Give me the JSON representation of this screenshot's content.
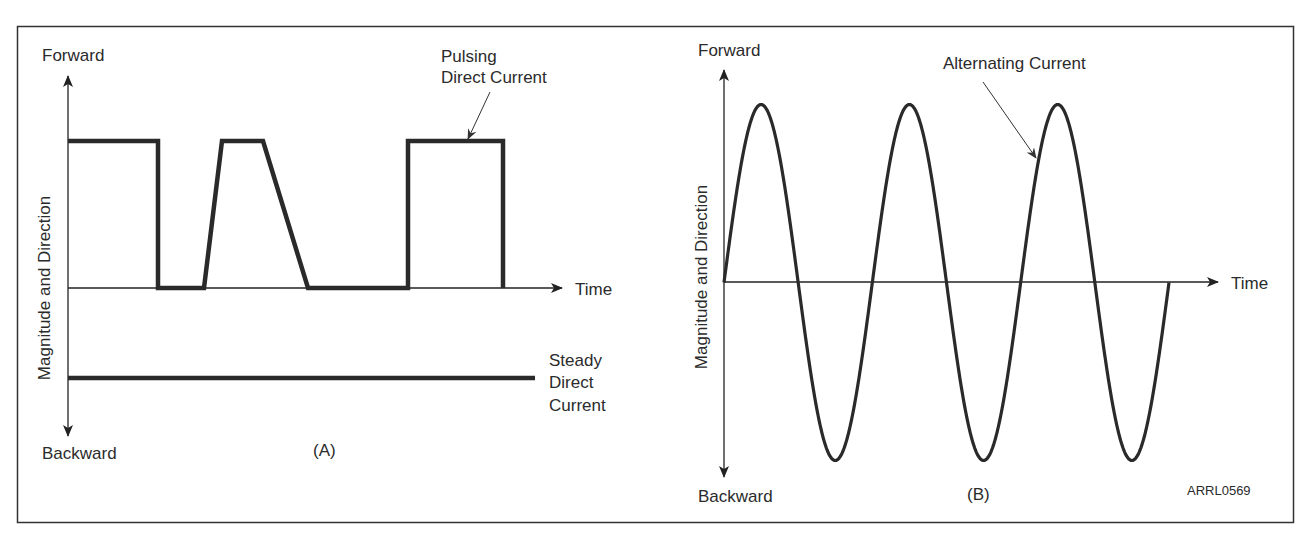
{
  "figure": {
    "id_label": "ARRL0569",
    "frame": {
      "stroke": "#333333"
    }
  },
  "panels": [
    {
      "key": "A",
      "caption": "(A)",
      "y_axis": {
        "top_label": "Forward",
        "bottom_label": "Backward",
        "title": "Magnitude and Direction"
      },
      "x_axis": {
        "label": "Time"
      },
      "annotations": [
        {
          "lines": [
            "Pulsing",
            "Direct Current"
          ]
        },
        {
          "lines": [
            "Steady",
            "Direct",
            "Current"
          ]
        }
      ]
    },
    {
      "key": "B",
      "caption": "(B)",
      "y_axis": {
        "top_label": "Forward",
        "bottom_label": "Backward",
        "title": "Magnitude and Direction"
      },
      "x_axis": {
        "label": "Time"
      },
      "annotations": [
        {
          "lines": [
            "Alternating Current"
          ]
        }
      ]
    }
  ],
  "chart_data": [
    {
      "type": "line",
      "title": "(A)",
      "xlabel": "Time",
      "ylabel": "Magnitude and Direction",
      "y_top_label": "Forward",
      "y_bottom_label": "Backward",
      "grid": false,
      "series": [
        {
          "name": "Pulsing Direct Current",
          "description": "Rectangular pulse, then trapezoidal pulse, then rectangular pulse; all above zero",
          "x": [
            0,
            0.22,
            0.22,
            0.33,
            0.38,
            0.45,
            0.54,
            0.76,
            0.76,
            0.99,
            0.99
          ],
          "y": [
            1,
            1,
            0,
            0,
            1,
            1,
            0,
            0,
            1,
            1,
            0
          ]
        },
        {
          "name": "Steady Direct Current",
          "description": "Constant level below zero line",
          "x": [
            0,
            1.1
          ],
          "y": [
            -0.6,
            -0.6
          ]
        }
      ]
    },
    {
      "type": "line",
      "title": "(B)",
      "xlabel": "Time",
      "ylabel": "Magnitude and Direction",
      "y_top_label": "Forward",
      "y_bottom_label": "Backward",
      "grid": false,
      "series": [
        {
          "name": "Alternating Current",
          "description": "Sine wave, 3 full cycles starting at zero going positive",
          "cycles": 3,
          "amplitude": 1,
          "x": [
            0,
            0.25,
            0.5,
            0.75,
            1,
            1.25,
            1.5,
            1.75,
            2,
            2.25,
            2.5,
            2.75,
            3
          ],
          "y": [
            0,
            1,
            0,
            -1,
            0,
            1,
            0,
            -1,
            0,
            1,
            0,
            -1,
            0
          ]
        }
      ]
    }
  ]
}
